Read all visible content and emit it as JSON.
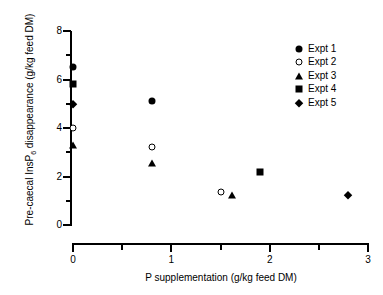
{
  "chart_data": {
    "type": "scatter",
    "title": "",
    "xlabel": "P supplementation (g/kg feed DM)",
    "ylabel_prefix": "Pre-caecal InsP",
    "ylabel_sub": "6",
    "ylabel_suffix": " disappearance (g/kg feed DM)",
    "ylabel": "Pre-caecal InsP6 disappearance (g/kg feed DM)",
    "xlim": [
      0,
      3
    ],
    "ylim": [
      0,
      8
    ],
    "xticks": [
      "0",
      "1",
      "2",
      "3"
    ],
    "xtick_values": [
      0,
      1,
      2,
      3
    ],
    "xminor_values": [
      0.5,
      1.5,
      2.5
    ],
    "yticks": [
      "0",
      "2",
      "4",
      "6",
      "8"
    ],
    "ytick_values": [
      0,
      2,
      4,
      6,
      8
    ],
    "yminor_values": [
      1,
      3,
      5,
      7
    ],
    "grid": false,
    "legend_position": "top-right",
    "series": [
      {
        "name": "Expt 1",
        "marker": "circle-filled",
        "points": [
          {
            "x": 0.0,
            "y": 6.5
          },
          {
            "x": 0.8,
            "y": 5.1
          }
        ]
      },
      {
        "name": "Expt 2",
        "marker": "circle-open",
        "points": [
          {
            "x": 0.0,
            "y": 4.0
          },
          {
            "x": 0.8,
            "y": 3.2
          },
          {
            "x": 1.5,
            "y": 1.35
          }
        ]
      },
      {
        "name": "Expt 3",
        "marker": "triangle-filled",
        "points": [
          {
            "x": 0.0,
            "y": 3.3
          },
          {
            "x": 0.8,
            "y": 2.55
          },
          {
            "x": 1.62,
            "y": 1.25
          }
        ]
      },
      {
        "name": "Expt 4",
        "marker": "square-filled",
        "points": [
          {
            "x": 0.0,
            "y": 5.8
          },
          {
            "x": 1.9,
            "y": 2.2
          }
        ]
      },
      {
        "name": "Expt 5",
        "marker": "diamond-filled",
        "points": [
          {
            "x": 0.0,
            "y": 5.0
          },
          {
            "x": 2.8,
            "y": 1.25
          }
        ]
      }
    ],
    "colors": {
      "marker": "#000000",
      "axis": "#000000",
      "background": "#ffffff"
    }
  }
}
